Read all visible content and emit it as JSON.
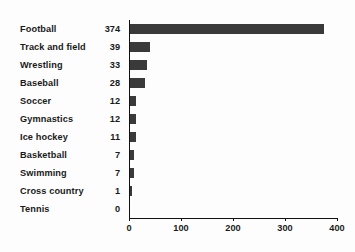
{
  "chart_data": {
    "type": "bar",
    "orientation": "horizontal",
    "title": "",
    "subtitle": "",
    "xlabel": "",
    "ylabel": "",
    "categories": [
      "Football",
      "Track and field",
      "Wrestling",
      "Baseball",
      "Soccer",
      "Gymnastics",
      "Ice hockey",
      "Basketball",
      "Swimming",
      "Cross country",
      "Tennis"
    ],
    "values": [
      374,
      39,
      33,
      28,
      12,
      12,
      11,
      7,
      7,
      1,
      0
    ],
    "value_labels": [
      "374",
      "39",
      "33",
      "28",
      "12",
      "12",
      "11",
      "7",
      "7",
      "1",
      "0"
    ],
    "xlim": [
      0,
      400
    ],
    "x_ticks": [
      0,
      100,
      200,
      300,
      400
    ],
    "x_tick_labels": [
      "0",
      "100",
      "200",
      "300",
      "400"
    ],
    "grid": false,
    "legend": false,
    "bar_color": "#3a3a3a",
    "axis_color": "#111111",
    "background_color": "#fdfdfd",
    "text_color": "#1a1a1a"
  }
}
